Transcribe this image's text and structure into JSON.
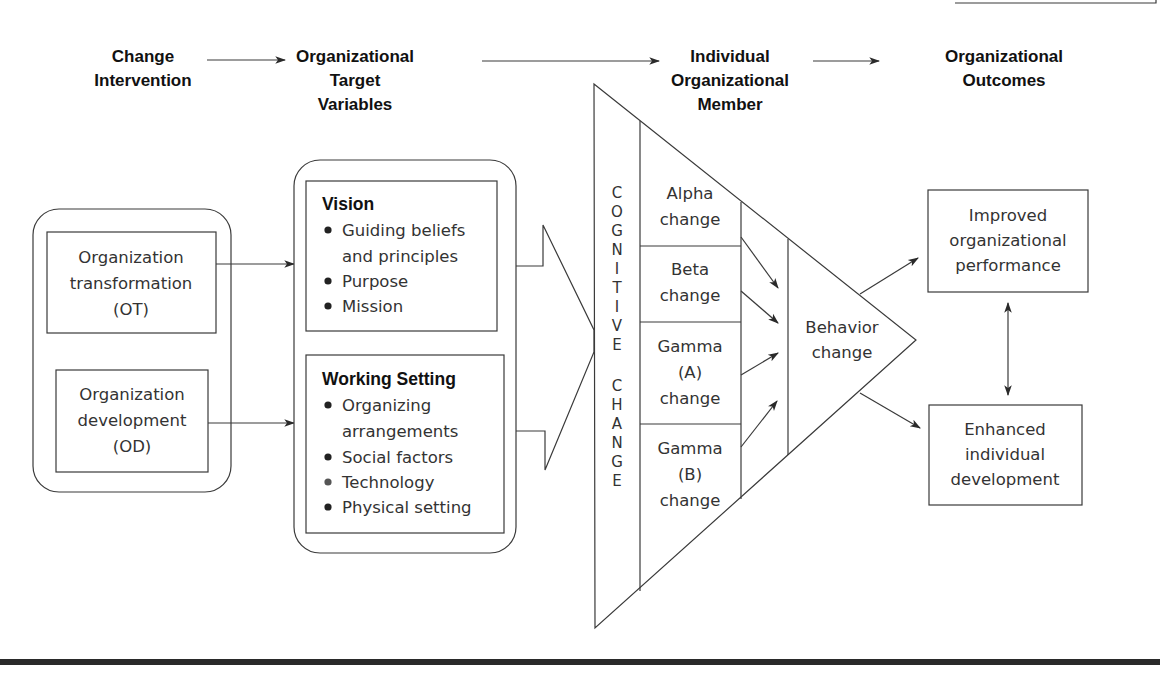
{
  "headers": [
    {
      "id": "change-intervention",
      "lines": [
        "Change",
        "Intervention"
      ]
    },
    {
      "id": "org-target-variables",
      "lines": [
        "Organizational",
        "Target",
        "Variables"
      ]
    },
    {
      "id": "individual-member",
      "lines": [
        "Individual",
        "Organizational",
        "Member"
      ]
    },
    {
      "id": "org-outcomes",
      "lines": [
        "Organizational",
        "Outcomes"
      ]
    }
  ],
  "interventions": {
    "ot": {
      "lines": [
        "Organization",
        "transformation",
        "(OT)"
      ]
    },
    "od": {
      "lines": [
        "Organization",
        "development",
        "(OD)"
      ]
    }
  },
  "target_variables": {
    "vision": {
      "title": "Vision",
      "bullets": [
        "Guiding beliefs",
        "and principles",
        "Purpose",
        "Mission"
      ],
      "bullet_marks": [
        true,
        false,
        true,
        true
      ]
    },
    "working_setting": {
      "title": "Working Setting",
      "bullets": [
        "Organizing",
        "arrangements",
        "Social factors",
        "Technology",
        "Physical setting"
      ],
      "bullet_marks": [
        true,
        false,
        true,
        true,
        true
      ]
    }
  },
  "cognitive_change": {
    "label": "COGNITIVE CHANGE",
    "letters_top": [
      "C",
      "O",
      "G",
      "N",
      "I",
      "T",
      "I",
      "V",
      "E"
    ],
    "letters_bottom": [
      "C",
      "H",
      "A",
      "N",
      "G",
      "E"
    ]
  },
  "change_types": [
    {
      "lines": [
        "Alpha",
        "change"
      ]
    },
    {
      "lines": [
        "Beta",
        "change"
      ]
    },
    {
      "lines": [
        "Gamma",
        "(A)",
        "change"
      ]
    },
    {
      "lines": [
        "Gamma",
        "(B)",
        "change"
      ]
    }
  ],
  "behavior_change": {
    "lines": [
      "Behavior",
      "change"
    ]
  },
  "outcomes": {
    "improved": {
      "lines": [
        "Improved",
        "organizational",
        "performance"
      ]
    },
    "enhanced": {
      "lines": [
        "Enhanced",
        "individual",
        "development"
      ]
    }
  },
  "colors": {
    "line": "#3a3a3a",
    "text": "#333333",
    "heading": "#111111",
    "footer_bar": "#2a2a2a"
  }
}
